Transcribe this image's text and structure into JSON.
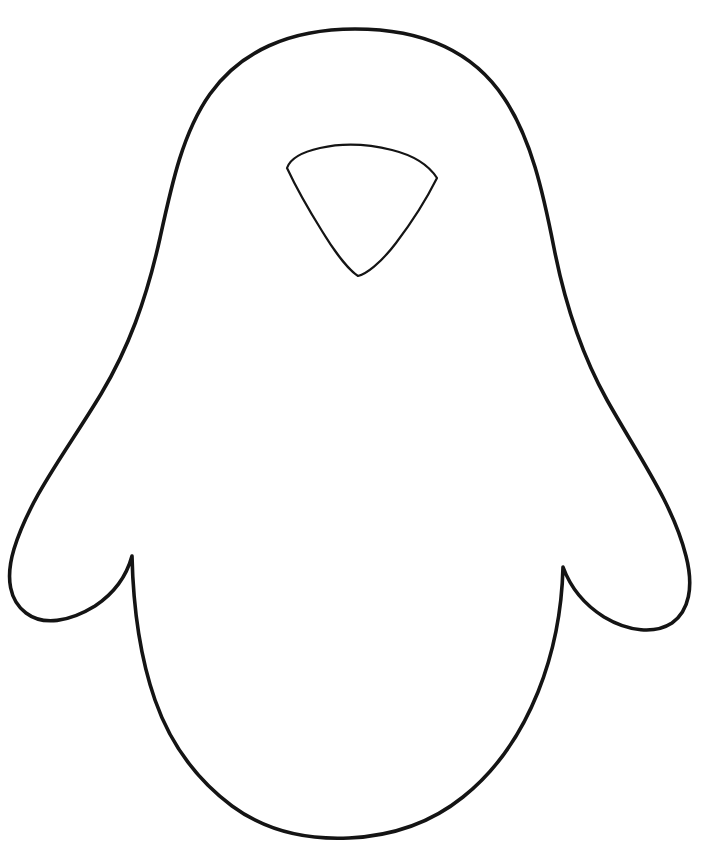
{
  "page": {
    "background_color": "#ffffff",
    "width": 708,
    "height": 841,
    "caption": "Penguin outline drawing"
  },
  "artwork": {
    "type": "line-art",
    "subject": "penguin",
    "style": "coloring page outline",
    "stroke_color": "#141414",
    "fill_color": "#ffffff",
    "body_stroke_width": 3.6,
    "face_stroke_width": 2.2,
    "shapes": [
      {
        "name": "penguin-body-outline",
        "description": "Outer silhouette: rounded head, shoulders, two pointed flippers and an oval belly",
        "path": "M 355 29 C 289 29 240 52 210 94 C 183 132 172 183 160 238 C 146 301 128 349 101 394 C 66 452 30 497 14 549 C 5 579 10 601 26 613 C 43 626 69 622 95 606 C 113 594 126 578 132 556 C 133 599 139 654 155 700 C 170 743 196 779 232 806 C 266 831 307 840 349 838 C 392 836 432 822 463 797 C 497 770 521 734 538 692 C 554 652 562 607 563 567 C 571 589 585 605 604 617 C 629 632 655 634 672 623 C 689 611 694 587 686 556 C 673 504 639 457 607 400 C 583 357 566 309 554 248 C 543 192 531 138 504 98 C 473 51 422 29 355 29 Z"
      },
      {
        "name": "penguin-face-patch",
        "description": "Rounded triangular face/beak patch near the top of the head",
        "path": "M 287 168 C 290 159 302 152 320 148 C 342 143 368 144 392 150 C 412 155 428 164 437 178 C 428 196 412 222 396 243 C 380 264 366 274 358 276 C 350 271 336 254 322 231 C 307 207 294 183 287 168 Z"
      }
    ]
  }
}
